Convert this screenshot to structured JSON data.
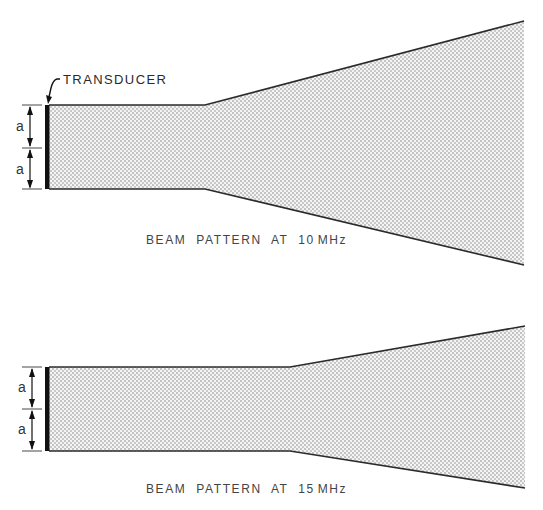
{
  "diagram": {
    "type": "ultrasonic transducer beam patterns",
    "callout": {
      "label": "TRANSDUCER"
    },
    "dimension_label": "a",
    "panels": [
      {
        "caption": "BEAM PATTERN AT 10 MHz",
        "caption_parts": {
          "text": "BEAM  PATTERN  AT  10",
          "unit": "MHz"
        },
        "frequency_mhz": 10,
        "geometry": {
          "transducer_x": 47,
          "top_y": 105,
          "mid_y": 148,
          "bottom_y": 189,
          "near_field_end_x": 205,
          "far_end_x": 524,
          "far_top_y": 21,
          "far_bottom_y": 265
        },
        "dimensions": [
          "a",
          "a"
        ]
      },
      {
        "caption": "BEAM PATTERN AT 15 MHz",
        "caption_parts": {
          "text": "BEAM  PATTERN  AT  15",
          "unit": "MHz"
        },
        "frequency_mhz": 15,
        "geometry": {
          "transducer_x": 47,
          "top_y": 367,
          "mid_y": 409,
          "bottom_y": 451,
          "near_field_end_x": 290,
          "far_end_x": 525,
          "far_top_y": 326,
          "far_bottom_y": 488
        },
        "dimensions": [
          "a",
          "a"
        ]
      }
    ],
    "colors": {
      "outline": "#2b2b2b",
      "stipple_dot": "#7a7a7a",
      "transducer": "#111111"
    }
  }
}
